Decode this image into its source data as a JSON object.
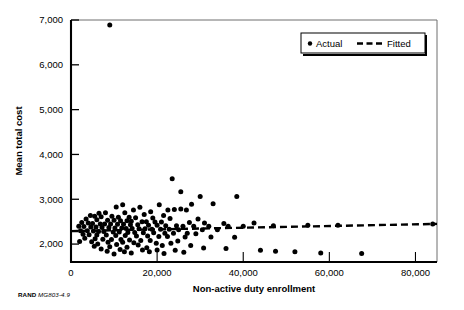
{
  "figure": {
    "source_note_brand": "RAND",
    "source_note_id": "MG803-4.9"
  },
  "chart_data": {
    "type": "scatter",
    "title": "",
    "subtitle": "",
    "xlabel": "Non-active duty enrollment",
    "ylabel": "Mean total cost",
    "xlim": [
      0,
      85000
    ],
    "ylim": [
      1600,
      7000
    ],
    "xticks": [
      0,
      20000,
      40000,
      60000,
      80000
    ],
    "xtick_labels": [
      "0",
      "20,000",
      "40,000",
      "60,000",
      "80,000"
    ],
    "yticks": [
      2000,
      3000,
      4000,
      5000,
      6000,
      7000
    ],
    "ytick_labels": [
      "2,000",
      "3,000",
      "4,000",
      "5,000",
      "6,000",
      "7,000"
    ],
    "grid": false,
    "legend_position": "top-right",
    "legend": [
      {
        "label": "Actual",
        "marker": "dot",
        "color": "#000000"
      },
      {
        "label": "Fitted",
        "marker": "dashed-line",
        "color": "#000000"
      }
    ],
    "series": [
      {
        "name": "Actual",
        "marker": "dot",
        "color": "#000000",
        "points": [
          [
            9000,
            6890
          ],
          [
            23500,
            3460
          ],
          [
            25500,
            3170
          ],
          [
            30000,
            3060
          ],
          [
            38500,
            3060
          ],
          [
            28000,
            2890
          ],
          [
            33000,
            2900
          ],
          [
            20500,
            2880
          ],
          [
            12000,
            2880
          ],
          [
            10500,
            2830
          ],
          [
            16000,
            2820
          ],
          [
            14500,
            2760
          ],
          [
            22500,
            2760
          ],
          [
            24000,
            2770
          ],
          [
            25500,
            2780
          ],
          [
            26800,
            2760
          ],
          [
            18500,
            2720
          ],
          [
            8000,
            2700
          ],
          [
            6500,
            2690
          ],
          [
            12500,
            2700
          ],
          [
            17000,
            2660
          ],
          [
            21500,
            2640
          ],
          [
            4500,
            2640
          ],
          [
            5500,
            2620
          ],
          [
            7000,
            2610
          ],
          [
            9500,
            2620
          ],
          [
            11000,
            2600
          ],
          [
            13500,
            2600
          ],
          [
            15000,
            2590
          ],
          [
            19000,
            2580
          ],
          [
            23000,
            2570
          ],
          [
            29500,
            2560
          ],
          [
            3500,
            2560
          ],
          [
            6000,
            2540
          ],
          [
            8500,
            2530
          ],
          [
            10000,
            2530
          ],
          [
            11500,
            2520
          ],
          [
            13000,
            2520
          ],
          [
            14000,
            2510
          ],
          [
            16500,
            2500
          ],
          [
            17500,
            2500
          ],
          [
            19500,
            2490
          ],
          [
            21000,
            2490
          ],
          [
            27500,
            2480
          ],
          [
            31000,
            2470
          ],
          [
            35500,
            2460
          ],
          [
            42500,
            2470
          ],
          [
            2500,
            2480
          ],
          [
            4000,
            2470
          ],
          [
            5000,
            2460
          ],
          [
            6800,
            2450
          ],
          [
            7800,
            2450
          ],
          [
            9200,
            2450
          ],
          [
            10800,
            2440
          ],
          [
            12200,
            2440
          ],
          [
            13800,
            2430
          ],
          [
            15500,
            2430
          ],
          [
            18000,
            2420
          ],
          [
            20000,
            2420
          ],
          [
            22000,
            2410
          ],
          [
            24500,
            2410
          ],
          [
            26000,
            2400
          ],
          [
            28500,
            2400
          ],
          [
            32000,
            2400
          ],
          [
            36500,
            2400
          ],
          [
            40000,
            2400
          ],
          [
            47000,
            2410
          ],
          [
            55000,
            2420
          ],
          [
            62000,
            2420
          ],
          [
            84000,
            2450
          ],
          [
            1800,
            2400
          ],
          [
            3000,
            2390
          ],
          [
            4600,
            2380
          ],
          [
            5800,
            2380
          ],
          [
            7200,
            2370
          ],
          [
            8800,
            2370
          ],
          [
            10200,
            2360
          ],
          [
            11800,
            2360
          ],
          [
            12800,
            2350
          ],
          [
            14200,
            2350
          ],
          [
            15800,
            2340
          ],
          [
            17200,
            2340
          ],
          [
            18800,
            2330
          ],
          [
            20800,
            2330
          ],
          [
            22800,
            2330
          ],
          [
            25000,
            2320
          ],
          [
            30500,
            2320
          ],
          [
            34000,
            2320
          ],
          [
            2200,
            2300
          ],
          [
            3800,
            2300
          ],
          [
            5200,
            2290
          ],
          [
            6400,
            2280
          ],
          [
            7600,
            2280
          ],
          [
            9800,
            2270
          ],
          [
            11200,
            2270
          ],
          [
            13200,
            2260
          ],
          [
            14800,
            2260
          ],
          [
            16800,
            2250
          ],
          [
            19200,
            2250
          ],
          [
            21800,
            2240
          ],
          [
            23800,
            2240
          ],
          [
            27000,
            2240
          ],
          [
            29000,
            2230
          ],
          [
            2800,
            2220
          ],
          [
            4200,
            2210
          ],
          [
            6000,
            2200
          ],
          [
            8200,
            2200
          ],
          [
            10400,
            2190
          ],
          [
            12600,
            2190
          ],
          [
            15200,
            2180
          ],
          [
            17800,
            2180
          ],
          [
            20400,
            2170
          ],
          [
            22400,
            2170
          ],
          [
            26500,
            2160
          ],
          [
            32500,
            2160
          ],
          [
            38000,
            2150
          ],
          [
            3200,
            2130
          ],
          [
            5600,
            2120
          ],
          [
            7400,
            2110
          ],
          [
            9400,
            2100
          ],
          [
            11600,
            2100
          ],
          [
            13600,
            2090
          ],
          [
            16200,
            2080
          ],
          [
            18400,
            2080
          ],
          [
            24800,
            2070
          ],
          [
            2000,
            2060
          ],
          [
            4800,
            2050
          ],
          [
            8600,
            2040
          ],
          [
            12000,
            2040
          ],
          [
            14600,
            2030
          ],
          [
            19800,
            2020
          ],
          [
            23200,
            2020
          ],
          [
            6200,
            2000
          ],
          [
            10600,
            1990
          ],
          [
            15600,
            1980
          ],
          [
            21200,
            1970
          ],
          [
            27800,
            1970
          ],
          [
            5400,
            1950
          ],
          [
            9000,
            1940
          ],
          [
            13000,
            1930
          ],
          [
            17600,
            1920
          ],
          [
            30800,
            1910
          ],
          [
            36000,
            1900
          ],
          [
            7000,
            1890
          ],
          [
            11400,
            1880
          ],
          [
            16600,
            1870
          ],
          [
            20000,
            1870
          ],
          [
            24200,
            1860
          ],
          [
            8400,
            1840
          ],
          [
            12400,
            1830
          ],
          [
            18200,
            1830
          ],
          [
            26200,
            1820
          ],
          [
            44000,
            1860
          ],
          [
            47500,
            1840
          ],
          [
            52000,
            1830
          ],
          [
            58000,
            1800
          ],
          [
            67500,
            1790
          ],
          [
            14000,
            1800
          ],
          [
            21600,
            1790
          ],
          [
            10000,
            1780
          ]
        ]
      }
    ],
    "fit_line": {
      "name": "Fitted",
      "style": "dashed",
      "color": "#000000",
      "x": [
        0,
        85000
      ],
      "y": [
        2290,
        2450
      ]
    }
  }
}
